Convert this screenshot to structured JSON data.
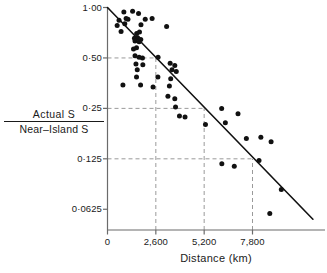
{
  "chart_data": {
    "type": "scatter",
    "title": "",
    "xlabel": "Distance  (km)",
    "ylabel_numerator": "Actual  S",
    "ylabel_denominator": "Near–Island  S",
    "grid": "dashed-guides",
    "legend": "none",
    "xlim": [
      0,
      11700
    ],
    "ylim": [
      0.047,
      1.0
    ],
    "yscale": "log2",
    "xticks": [
      0,
      2600,
      5200,
      7800
    ],
    "xtick_labels": [
      "0",
      "2,600",
      "5,200",
      "7,800"
    ],
    "yticks": [
      1.0,
      0.5,
      0.25,
      0.125,
      0.0625
    ],
    "ytick_labels": [
      "1·00",
      "0·50",
      "0·25",
      "0·125",
      "0·0625"
    ],
    "guide_lines": {
      "horizontal": [
        {
          "y": 0.5,
          "x_from": 0,
          "x_to": 2600
        },
        {
          "y": 0.25,
          "x_from": 0,
          "x_to": 5200
        },
        {
          "y": 0.125,
          "x_from": 0,
          "x_to": 7800
        }
      ],
      "vertical": [
        {
          "x": 2600,
          "y_from": 0.047,
          "y_to": 0.5
        },
        {
          "x": 5200,
          "y_from": 0.047,
          "y_to": 0.25
        },
        {
          "x": 7800,
          "y_from": 0.047,
          "y_to": 0.125
        }
      ]
    },
    "fit_line": {
      "name": "regression-line",
      "points": [
        [
          0,
          1.0
        ],
        [
          11050,
          0.0545
        ]
      ]
    },
    "series": [
      {
        "name": "islands",
        "marker": "filled-circle",
        "color": "#111111",
        "points": [
          [
            880,
            0.94
          ],
          [
            1350,
            0.95
          ],
          [
            1670,
            0.92
          ],
          [
            620,
            0.84
          ],
          [
            1000,
            0.86
          ],
          [
            1100,
            0.85
          ],
          [
            2030,
            0.85
          ],
          [
            2400,
            0.86
          ],
          [
            520,
            0.78
          ],
          [
            930,
            0.8
          ],
          [
            1800,
            0.79
          ],
          [
            3180,
            0.77
          ],
          [
            730,
            0.72
          ],
          [
            1570,
            0.7
          ],
          [
            1720,
            0.715
          ],
          [
            1450,
            0.655
          ],
          [
            1620,
            0.66
          ],
          [
            1790,
            0.645
          ],
          [
            1480,
            0.63
          ],
          [
            1700,
            0.625
          ],
          [
            1400,
            0.565
          ],
          [
            1560,
            0.575
          ],
          [
            1480,
            0.515
          ],
          [
            1700,
            0.505
          ],
          [
            1880,
            0.5
          ],
          [
            2720,
            0.505
          ],
          [
            1530,
            0.46
          ],
          [
            1900,
            0.455
          ],
          [
            3370,
            0.465
          ],
          [
            3620,
            0.45
          ],
          [
            1600,
            0.425
          ],
          [
            3470,
            0.425
          ],
          [
            3700,
            0.415
          ],
          [
            1560,
            0.385
          ],
          [
            2710,
            0.385
          ],
          [
            3400,
            0.375
          ],
          [
            830,
            0.345
          ],
          [
            1780,
            0.345
          ],
          [
            2450,
            0.335
          ],
          [
            3330,
            0.34
          ],
          [
            3250,
            0.295
          ],
          [
            3620,
            0.285
          ],
          [
            3660,
            0.255
          ],
          [
            6140,
            0.25
          ],
          [
            3870,
            0.225
          ],
          [
            4170,
            0.222
          ],
          [
            7020,
            0.232
          ],
          [
            5270,
            0.2
          ],
          [
            6340,
            0.205
          ],
          [
            7470,
            0.165
          ],
          [
            8250,
            0.168
          ],
          [
            8800,
            0.158
          ],
          [
            6150,
            0.117
          ],
          [
            6820,
            0.113
          ],
          [
            8150,
            0.122
          ],
          [
            9350,
            0.082
          ],
          [
            8730,
            0.059
          ]
        ]
      }
    ]
  },
  "axis_style": {
    "axis_color": "#6b6b6b",
    "line_color": "#111111",
    "guide_color": "#9a9a9a",
    "marker_color": "#111111"
  }
}
